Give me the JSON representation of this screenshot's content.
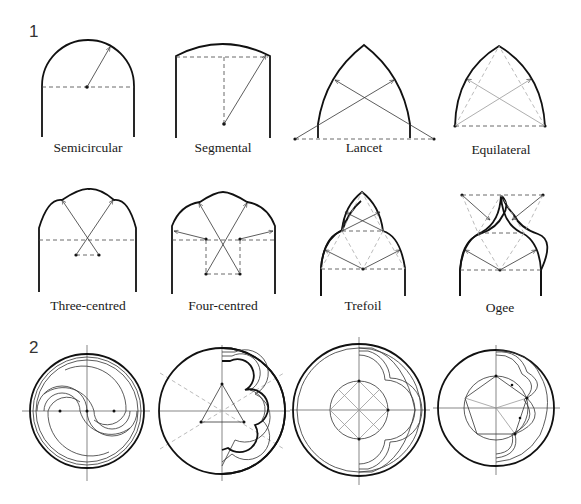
{
  "figure": {
    "section_1": {
      "number": "1",
      "arches": [
        {
          "label": "Semicircular"
        },
        {
          "label": "Segmental"
        },
        {
          "label": "Lancet"
        },
        {
          "label": "Equilateral"
        },
        {
          "label": "Three-centred"
        },
        {
          "label": "Four-centred"
        },
        {
          "label": "Trefoil"
        },
        {
          "label": "Ogee"
        }
      ]
    },
    "section_2": {
      "number": "2",
      "circles": [
        {
          "name": "two-mouchettes"
        },
        {
          "name": "three-lobed-trefoil"
        },
        {
          "name": "four-lobed-quatrefoil"
        },
        {
          "name": "five-lobed-cinquefoil"
        }
      ]
    }
  }
}
